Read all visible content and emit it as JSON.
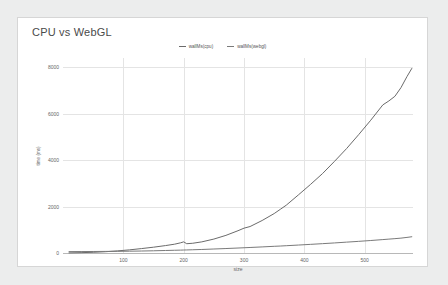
{
  "chart": {
    "title": "CPU vs WebGL",
    "xlabel": "size",
    "ylabel": "time (ms)"
  },
  "legend": [
    {
      "label": "wallMs(cpu)",
      "color": "#6b6b6b"
    },
    {
      "label": "wallMs(webgl)",
      "color": "#7a7a7a"
    }
  ],
  "chart_data": {
    "type": "line",
    "title": "CPU vs WebGL",
    "xlabel": "size",
    "ylabel": "time (ms)",
    "xlim": [
      0,
      580
    ],
    "ylim": [
      0,
      8400
    ],
    "xticks": [
      100,
      200,
      300,
      400,
      500
    ],
    "yticks": [
      0,
      2000,
      4000,
      6000,
      8000
    ],
    "grid": true,
    "legend_position": "top-center",
    "x": [
      10,
      30,
      50,
      70,
      90,
      110,
      130,
      150,
      170,
      185,
      195,
      200,
      205,
      215,
      230,
      250,
      270,
      290,
      300,
      310,
      330,
      350,
      360,
      370,
      390,
      410,
      430,
      450,
      470,
      490,
      510,
      530,
      540,
      550,
      560,
      570,
      578
    ],
    "series": [
      {
        "name": "wallMs(cpu)",
        "color": "#6b6b6b",
        "values": [
          5,
          15,
          30,
          55,
          90,
          135,
          190,
          250,
          320,
          380,
          440,
          480,
          400,
          420,
          480,
          600,
          760,
          960,
          1070,
          1140,
          1400,
          1700,
          1880,
          2060,
          2500,
          2950,
          3420,
          3950,
          4500,
          5100,
          5720,
          6380,
          6550,
          6750,
          7120,
          7600,
          7950
        ]
      },
      {
        "name": "wallMs(webgl)",
        "color": "#7a7a7a",
        "values": [
          60,
          62,
          65,
          68,
          72,
          78,
          85,
          95,
          108,
          118,
          124,
          128,
          132,
          140,
          152,
          172,
          192,
          214,
          226,
          238,
          262,
          288,
          300,
          314,
          342,
          372,
          402,
          434,
          468,
          502,
          538,
          578,
          598,
          618,
          640,
          672,
          700
        ]
      }
    ]
  }
}
